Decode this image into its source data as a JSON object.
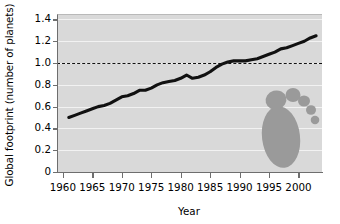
{
  "chart_data": {
    "type": "line",
    "title": "",
    "xlabel": "Year",
    "ylabel": "Global footprint (number of planets)",
    "xlim": [
      1959,
      2004
    ],
    "ylim": [
      0,
      1.45
    ],
    "grid": true,
    "legend": null,
    "xticks": [
      1960,
      1965,
      1970,
      1975,
      1980,
      1985,
      1990,
      1995,
      2000
    ],
    "xtick_labels": [
      "1960",
      "1965",
      "1970",
      "1975",
      "1980",
      "1985",
      "1990",
      "1995",
      "2000"
    ],
    "yticks": [
      0,
      0.2,
      0.4,
      0.6,
      0.8,
      1.0,
      1.2,
      1.4
    ],
    "ytick_labels": [
      "0",
      "0.2",
      "0.4",
      "0.6",
      "0.8",
      "1.0",
      "1.2",
      "1.4"
    ],
    "annotations": [
      {
        "name": "one-planet-threshold",
        "type": "hline",
        "y": 1.0,
        "style": "dashed",
        "color": "#111111"
      },
      {
        "name": "footprint-graphic",
        "type": "decorative-icon",
        "description": "gray human footprint with five toes",
        "color": "#9a9a9a"
      }
    ],
    "series": [
      {
        "name": "Global ecological footprint",
        "color": "#111111",
        "x": [
          1961,
          1962,
          1963,
          1964,
          1965,
          1966,
          1967,
          1968,
          1969,
          1970,
          1971,
          1972,
          1973,
          1974,
          1975,
          1976,
          1977,
          1978,
          1979,
          1980,
          1981,
          1982,
          1983,
          1984,
          1985,
          1986,
          1987,
          1988,
          1989,
          1990,
          1991,
          1992,
          1993,
          1994,
          1995,
          1996,
          1997,
          1998,
          1999,
          2000,
          2001,
          2002,
          2003
        ],
        "values": [
          0.5,
          0.52,
          0.54,
          0.56,
          0.58,
          0.6,
          0.61,
          0.63,
          0.66,
          0.69,
          0.7,
          0.72,
          0.75,
          0.75,
          0.77,
          0.8,
          0.82,
          0.83,
          0.84,
          0.86,
          0.89,
          0.86,
          0.87,
          0.89,
          0.92,
          0.96,
          0.99,
          1.01,
          1.02,
          1.02,
          1.02,
          1.03,
          1.04,
          1.06,
          1.08,
          1.1,
          1.13,
          1.14,
          1.16,
          1.18,
          1.2,
          1.23,
          1.25
        ]
      }
    ]
  },
  "colors": {
    "plot_background": "#d9d9d9",
    "gridline": "#f2f2f2",
    "axis": "#6e6e6e",
    "line": "#111111",
    "footprint": "#9a9a9a",
    "text": "#000000"
  }
}
